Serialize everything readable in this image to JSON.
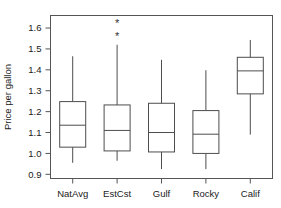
{
  "chart_data": {
    "type": "box",
    "title": "",
    "xlabel": "",
    "ylabel": "Price per gallon",
    "categories": [
      "NatAvg",
      "EstCst",
      "Gulf",
      "Rocky",
      "Calif"
    ],
    "ylim": [
      0.88,
      1.66
    ],
    "yticks": [
      0.9,
      1.0,
      1.1,
      1.2,
      1.3,
      1.4,
      1.5,
      1.6
    ],
    "ytick_labels": [
      "0.9",
      "1.0",
      "1.1",
      "1.2",
      "1.3",
      "1.4",
      "1.5",
      "1.6"
    ],
    "grid": false,
    "legend": false,
    "frame": "box",
    "boxes": [
      {
        "name": "NatAvg",
        "whisker_low": 0.955,
        "q1": 1.03,
        "median": 1.135,
        "q3": 1.248,
        "whisker_high": 1.465,
        "outliers": []
      },
      {
        "name": "EstCst",
        "whisker_low": 0.965,
        "q1": 1.012,
        "median": 1.11,
        "q3": 1.232,
        "whisker_high": 1.52,
        "outliers": [
          1.562,
          1.625
        ]
      },
      {
        "name": "Gulf",
        "whisker_low": 0.925,
        "q1": 1.007,
        "median": 1.1,
        "q3": 1.24,
        "whisker_high": 1.448,
        "outliers": []
      },
      {
        "name": "Rocky",
        "whisker_low": 0.925,
        "q1": 1.0,
        "median": 1.092,
        "q3": 1.205,
        "whisker_high": 1.398,
        "outliers": []
      },
      {
        "name": "Calif",
        "whisker_low": 1.09,
        "q1": 1.285,
        "median": 1.395,
        "q3": 1.46,
        "whisker_high": 1.543,
        "outliers": []
      }
    ],
    "colors": {
      "line": "#4d4d4d",
      "frame": "#555555",
      "text": "#1a1a1a",
      "background": "#ffffff",
      "outlier_marker": "#333333"
    },
    "outlier_marker": "asterisk"
  },
  "axis": {
    "ylabel": "Price per gallon",
    "ytick_labels": [
      "1.6",
      "1.5",
      "1.4",
      "1.3",
      "1.2",
      "1.1",
      "1.0",
      "0.9"
    ],
    "xtick_labels": [
      "NatAvg",
      "EstCst",
      "Gulf",
      "Rocky",
      "Calif"
    ]
  }
}
